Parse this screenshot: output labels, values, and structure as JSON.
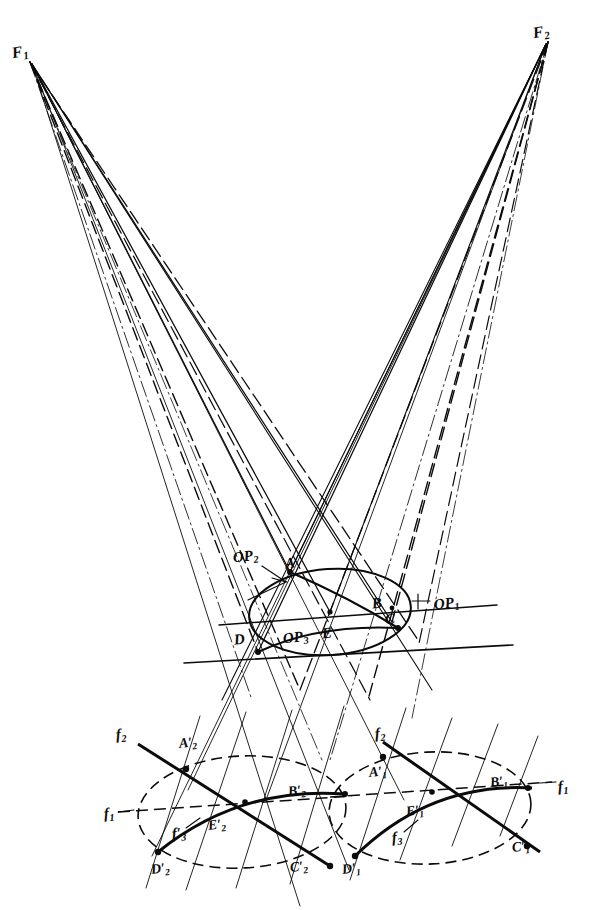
{
  "figure": {
    "background_color": "#ffffff",
    "ink_color": "#0b0b0b",
    "width": 596,
    "height": 910
  },
  "labels": {
    "focus_left": {
      "text": "F",
      "sub": "1",
      "x": 12,
      "y": 44,
      "size": "s16",
      "rot": "rot-2"
    },
    "focus_right": {
      "text": "F",
      "sub": "2",
      "x": 533,
      "y": 24,
      "size": "s16",
      "rot": "rot-2"
    },
    "op1": {
      "text": "OP",
      "sub": "1",
      "x": 434,
      "y": 596,
      "size": "s15",
      "rot": "rot-1"
    },
    "op2": {
      "text": "OP",
      "sub": "2",
      "x": 233,
      "y": 549,
      "size": "s15",
      "rot": "rot-1"
    },
    "op3": {
      "text": "OP",
      "sub": "3",
      "x": 283,
      "y": 630,
      "size": "s15",
      "rot": "rot-1"
    },
    "pt_a": {
      "text": "A",
      "sub": "",
      "x": 285,
      "y": 556,
      "size": "s15",
      "rot": "rot-1"
    },
    "pt_b": {
      "text": "B",
      "sub": "",
      "x": 372,
      "y": 596,
      "size": "s15",
      "rot": "rot-1"
    },
    "pt_c": {
      "text": "C",
      "sub": "",
      "x": 385,
      "y": 612,
      "size": "s15",
      "rot": "rot-1"
    },
    "pt_d": {
      "text": "D",
      "sub": "",
      "x": 234,
      "y": 632,
      "size": "s15",
      "rot": "rot-1"
    },
    "pt_e": {
      "text": "E",
      "sub": "",
      "x": 322,
      "y": 626,
      "size": "s15",
      "rot": "rot-1"
    },
    "f1_left": {
      "text": "f",
      "sub": "1",
      "x": 104,
      "y": 806,
      "size": "s15",
      "rot": "rot-3"
    },
    "f1_right": {
      "text": "f",
      "sub": "1",
      "x": 558,
      "y": 779,
      "size": "s15",
      "rot": "rot-3"
    },
    "f2_left": {
      "text": "f",
      "sub": "2",
      "x": 116,
      "y": 727,
      "size": "s15",
      "rot": "rot-3"
    },
    "f2_right": {
      "text": "f",
      "sub": "2",
      "x": 375,
      "y": 726,
      "size": "s15",
      "rot": "rot-3"
    },
    "f3_left": {
      "text": "f",
      "sub": "3",
      "prime": true,
      "x": 172,
      "y": 826,
      "size": "s15",
      "rot": "rot-3"
    },
    "f3_right": {
      "text": "f",
      "sub": "3",
      "x": 392,
      "y": 830,
      "size": "s15",
      "rot": "rot-3"
    },
    "a1": {
      "text": "A",
      "sub": "1",
      "prime": true,
      "x": 369,
      "y": 765,
      "size": "s14",
      "rot": "rot-1"
    },
    "b1": {
      "text": "B",
      "sub": "1",
      "prime": true,
      "x": 490,
      "y": 775,
      "size": "s14",
      "rot": "rot-1"
    },
    "c1": {
      "text": "C",
      "sub": "1",
      "prime": true,
      "x": 512,
      "y": 840,
      "size": "s14",
      "rot": "rot-1"
    },
    "d1": {
      "text": "D",
      "sub": "1",
      "prime": true,
      "x": 342,
      "y": 862,
      "size": "s14",
      "rot": "rot-1"
    },
    "e1": {
      "text": "E",
      "sub": "1",
      "prime": true,
      "x": 406,
      "y": 804,
      "size": "s14",
      "rot": "rot-1"
    },
    "a2": {
      "text": "A",
      "sub": "2",
      "prime": true,
      "x": 179,
      "y": 736,
      "size": "s14",
      "rot": "rot-1"
    },
    "b2": {
      "text": "B",
      "sub": "2",
      "prime": true,
      "x": 288,
      "y": 784,
      "size": "s14",
      "rot": "rot-1"
    },
    "c2": {
      "text": "C",
      "sub": "2",
      "prime": true,
      "x": 290,
      "y": 860,
      "size": "s14",
      "rot": "rot-1"
    },
    "d2": {
      "text": "D",
      "sub": "2",
      "prime": true,
      "x": 151,
      "y": 862,
      "size": "s14",
      "rot": "rot-1"
    },
    "e2": {
      "text": "E",
      "sub": "2",
      "prime": true,
      "x": 208,
      "y": 818,
      "size": "s14",
      "rot": "rot-1"
    }
  },
  "geometry": {
    "focus_left_point": [
      30,
      62
    ],
    "focus_right_point": [
      548,
      42
    ],
    "center_ellipse": {
      "cx": 330,
      "cy": 612,
      "rx": 81,
      "ry": 43,
      "rotation": -4
    },
    "lower_ellipse_left": {
      "cx": 242,
      "cy": 812,
      "rx": 104,
      "ry": 56,
      "rotation": -3
    },
    "lower_ellipse_right": {
      "cx": 430,
      "cy": 808,
      "rx": 101,
      "ry": 56,
      "rotation": -3
    },
    "horizontal_line_upper": [
      [
        219,
        625
      ],
      [
        497,
        605
      ]
    ],
    "horizontal_line_lower": [
      [
        184,
        663
      ],
      [
        513,
        645
      ]
    ],
    "rays_from_F1": 7,
    "rays_from_F2": 7,
    "line_styles": [
      "solid",
      "dashed",
      "dash-dot",
      "thin"
    ]
  }
}
